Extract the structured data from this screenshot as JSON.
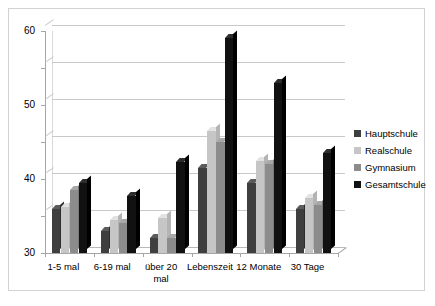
{
  "chart_data": {
    "type": "bar",
    "title": "",
    "subtitle": "",
    "xlabel": "",
    "ylabel": "",
    "ylim": [
      0,
      60
    ],
    "yticks": [
      0,
      10,
      20,
      30,
      40,
      50,
      60
    ],
    "ytick_labels": [
      "0",
      "10",
      "20",
      "30",
      "40",
      "50",
      "60"
    ],
    "grid": true,
    "legend_position": "right",
    "categories": [
      "1-5 mal",
      "6-19 mal",
      "über 20 mal",
      "Lebenszeit",
      "12 Monate",
      "30 Tage"
    ],
    "series": [
      {
        "name": "Hauptschule",
        "color": "#3f3f3f",
        "values": [
          12,
          6,
          4,
          23,
          19,
          12
        ]
      },
      {
        "name": "Realschule",
        "color": "#c6c6c6",
        "values": [
          12.5,
          9,
          9.5,
          33,
          25,
          15
        ]
      },
      {
        "name": "Gymnasium",
        "color": "#8c8c8c",
        "values": [
          17,
          8,
          4,
          30,
          24,
          13
        ]
      },
      {
        "name": "Gesamtschule",
        "color": "#111111",
        "values": [
          19,
          15.5,
          24.5,
          58,
          46,
          27
        ]
      }
    ]
  },
  "legend": {
    "items": [
      {
        "label": "Hauptschule",
        "color": "#3f3f3f"
      },
      {
        "label": "Realschule",
        "color": "#c6c6c6"
      },
      {
        "label": "Gymnasium",
        "color": "#8c8c8c"
      },
      {
        "label": "Gesamtschule",
        "color": "#111111"
      }
    ]
  },
  "axes": {
    "y_tick_labels": [
      "60",
      "50",
      "40",
      "30",
      "20",
      "10",
      "0"
    ],
    "x_tick_labels": [
      "1-5 mal",
      "6-19 mal",
      "über 20 mal",
      "Lebenszeit",
      "12 Monate",
      "30 Tage"
    ]
  },
  "style": {
    "frame_border_color": "#d2d2d2",
    "gridline_color": "#c9c9c9",
    "axis_color": "#a6a6a6",
    "background": "#ffffff"
  }
}
